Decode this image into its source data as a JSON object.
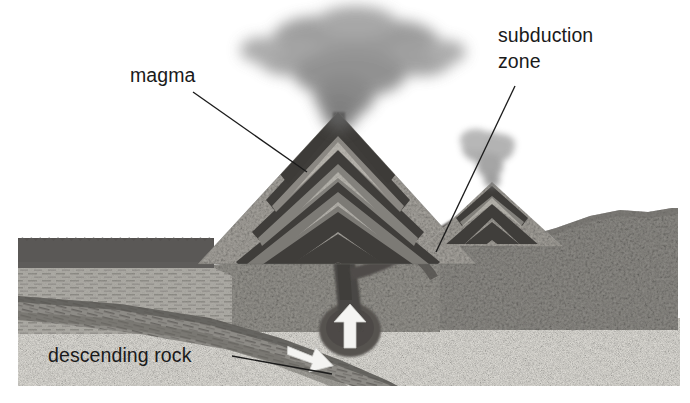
{
  "figure": {
    "type": "geological-cross-section",
    "background_color": "#ffffff",
    "canvas": {
      "width": 690,
      "height": 403
    }
  },
  "labels": {
    "magma": {
      "text": "magma",
      "x": 130,
      "y": 82,
      "leader_from": [
        193,
        92
      ],
      "leader_to": [
        307,
        172
      ]
    },
    "subduction_zone": {
      "line1": "subduction",
      "line2": "zone",
      "x": 498,
      "y": 42,
      "line2_y": 68,
      "leader_from": [
        515,
        86
      ],
      "leader_to": [
        436,
        252
      ]
    },
    "descending_rock": {
      "text": "descending rock",
      "x": 48,
      "y": 362,
      "leader_from": [
        232,
        356
      ],
      "leader_to": [
        330,
        372
      ]
    }
  },
  "colors": {
    "label_text": "#1a1a1a",
    "leader_line": "#1b1b1b",
    "ocean_water": "#585858",
    "ocean_water_deep": "#6e6e6e",
    "sediment_layers": "#a8a6a0",
    "continental_crust": "#8e8c88",
    "mantle_light": "#dedcd6",
    "magma_conduit": "#4a4744",
    "magma_chamber": "#565350",
    "volcano_strata_dark": "#3d3b38",
    "volcano_strata_light": "#b4b1aa",
    "ash_plume": "#8a8a8a",
    "arrow_white": "#f4f4f2",
    "descending_slab": "#7b7975"
  },
  "features": {
    "main_volcano": {
      "name": "stratovolcano",
      "apex_x": 338,
      "apex_y": 118,
      "base_left_x": 196,
      "base_right_x": 470,
      "base_y": 262,
      "strata_band_count": 8
    },
    "secondary_volcano": {
      "name": "secondary stratovolcano",
      "apex_x": 492,
      "apex_y": 186,
      "base_left_x": 432,
      "base_right_x": 556,
      "base_y": 240,
      "strata_band_count": 4
    },
    "ash_plume_main": {
      "name": "eruption ash plume",
      "center_x": 352,
      "center_y": 52,
      "width": 190,
      "height": 98
    },
    "ash_plume_secondary": {
      "name": "small ash puff",
      "center_x": 490,
      "center_y": 152,
      "width": 62,
      "height": 44
    },
    "magma_chamber": {
      "name": "magma chamber",
      "center_x": 348,
      "center_y": 330,
      "rx": 30,
      "ry": 26
    },
    "arrows": [
      {
        "name": "rising-magma-arrow",
        "direction": "up",
        "x": 344,
        "y": 326
      },
      {
        "name": "descending-slab-arrow",
        "direction": "down-right",
        "x": 312,
        "y": 356
      }
    ],
    "ocean": {
      "name": "ocean water body",
      "surface_y": 236,
      "left_x": 18,
      "right_x": 210,
      "scallop_count": 22
    },
    "layers": [
      {
        "name": "ocean water",
        "top": 236,
        "bottom": 272
      },
      {
        "name": "oceanic sediment",
        "top": 272,
        "bottom": 330
      },
      {
        "name": "descending oceanic plate",
        "top": 300,
        "bottom": 386
      },
      {
        "name": "lower mantle",
        "top": 330,
        "bottom": 386
      }
    ]
  }
}
